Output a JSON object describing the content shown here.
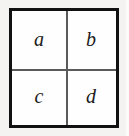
{
  "figure": {
    "type": "matrix-2x2",
    "background_color": "#f4f3f1",
    "cell_background_color": "#ffffff",
    "border_color": "#111111",
    "divider_color": "#5a5a5a",
    "text_color": "#1b1b1b",
    "rows": 2,
    "columns": 2,
    "cells": [
      {
        "label": "a",
        "row": 0,
        "column": 0,
        "name": "cell-a"
      },
      {
        "label": "b",
        "row": 0,
        "column": 1,
        "name": "cell-b"
      },
      {
        "label": "c",
        "row": 1,
        "column": 0,
        "name": "cell-c"
      },
      {
        "label": "d",
        "row": 1,
        "column": 1,
        "name": "cell-d"
      }
    ]
  }
}
